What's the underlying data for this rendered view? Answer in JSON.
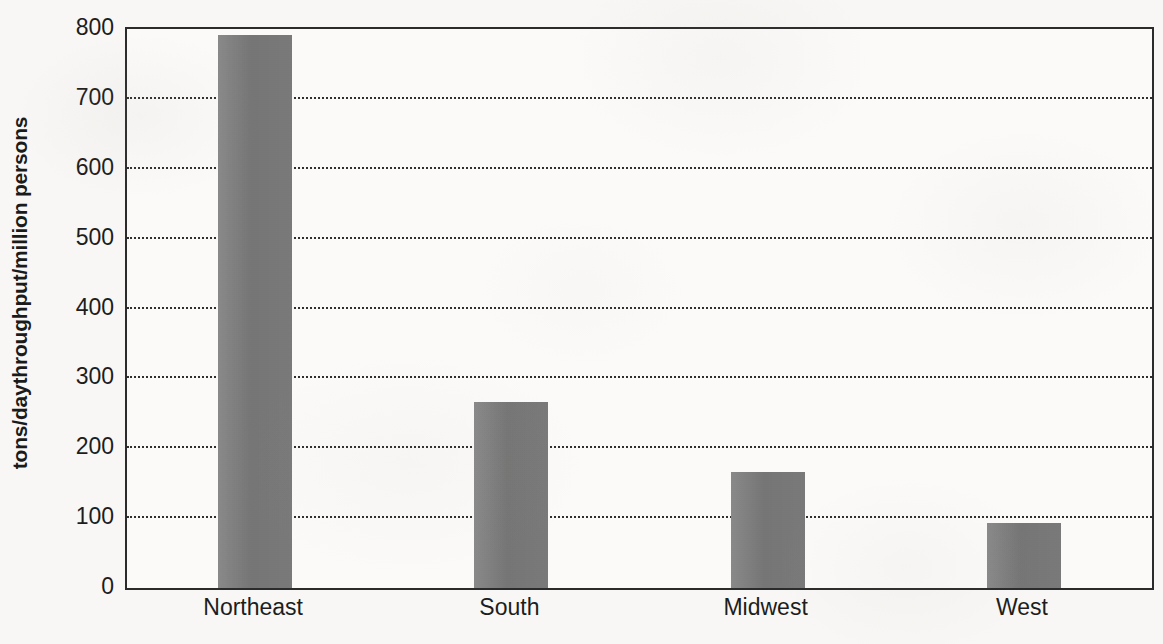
{
  "chart_data": {
    "type": "bar",
    "title": "",
    "subtitle": "",
    "xlabel": "",
    "ylabel": "tons/daythroughput/million persons",
    "categories": [
      "Northeast",
      "South",
      "Midwest",
      "West"
    ],
    "values": [
      792,
      266,
      166,
      93
    ],
    "series": [
      {
        "name": "throughput",
        "values": [
          792,
          266,
          166,
          93
        ]
      }
    ],
    "ylim": [
      0,
      800
    ],
    "yticks": [
      0,
      100,
      200,
      300,
      400,
      500,
      600,
      700,
      800
    ],
    "ytick_labels": [
      "0",
      "100",
      "200",
      "300",
      "400",
      "500",
      "600",
      "700",
      "800"
    ],
    "grid": true,
    "grid_axis": "y",
    "grid_style": "dotted",
    "legend": false,
    "legend_position": "none",
    "bar_color": "#7c7c7c",
    "axis_color": "#2b2b2b",
    "text_color": "#1d1d1d",
    "background_color": "#f8f7f5"
  }
}
